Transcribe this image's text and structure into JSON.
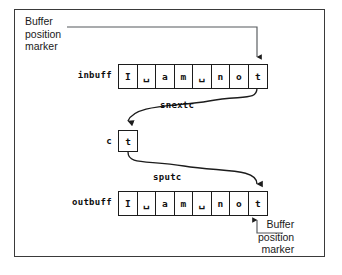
{
  "annotations": {
    "top_marker": {
      "line1": "Buffer",
      "line2": "position",
      "line3": "marker"
    },
    "bottom_marker": {
      "line1": "Buffer",
      "line2": "position",
      "line3": "marker"
    }
  },
  "labels": {
    "inbuff": "inbuff",
    "outbuff": "outbuff",
    "c": "c",
    "snextc": "snextc",
    "sputc": "sputc"
  },
  "buffers": {
    "inbuff": {
      "name": "inbuff",
      "cells": [
        "I",
        "␣",
        "a",
        "m",
        "␣",
        "n",
        "o",
        "t"
      ]
    },
    "outbuff": {
      "name": "outbuff",
      "cells": [
        "I",
        "␣",
        "a",
        "m",
        "␣",
        "n",
        "o",
        "t"
      ]
    },
    "charbox": {
      "name": "c",
      "value": "t"
    }
  },
  "colors": {
    "frame": "#3a3a3a",
    "line": "#1c1c1c",
    "text": "#101010",
    "background": "#ffffff"
  }
}
